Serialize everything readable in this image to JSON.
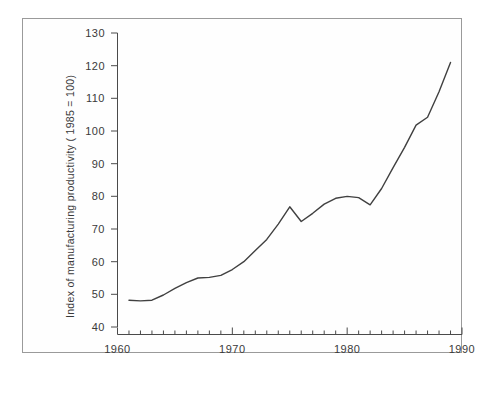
{
  "chart_data": {
    "type": "line",
    "title": "",
    "xlabel": "",
    "ylabel": "Index of manufacturing productivity ( 1985 = 100)",
    "xlim": [
      1960,
      1990
    ],
    "ylim": [
      40,
      130
    ],
    "grid": false,
    "legend": null,
    "y_ticks": [
      40,
      50,
      60,
      70,
      80,
      90,
      100,
      110,
      120,
      130
    ],
    "x_ticks_major": [
      1960,
      1970,
      1980,
      1990
    ],
    "x_tick_labels": [
      "1960",
      "1970",
      "1980",
      "1990"
    ],
    "x_minor_tick_interval": 1,
    "series": [
      {
        "name": "Index of manufacturing productivity",
        "x": [
          1961,
          1962,
          1963,
          1964,
          1965,
          1966,
          1967,
          1968,
          1969,
          1970,
          1971,
          1972,
          1973,
          1974,
          1975,
          1976,
          1977,
          1978,
          1979,
          1980,
          1981,
          1982,
          1983,
          1984,
          1985,
          1986,
          1987,
          1988,
          1989
        ],
        "values": [
          48.2,
          48.0,
          48.2,
          49.8,
          51.8,
          53.6,
          55.0,
          55.2,
          55.8,
          57.6,
          60.0,
          63.4,
          66.8,
          71.5,
          76.8,
          72.3,
          74.8,
          77.6,
          79.4,
          80.0,
          79.6,
          77.4,
          82.4,
          88.8,
          95.0,
          101.8,
          104.2,
          112.0,
          121.0
        ]
      }
    ]
  },
  "axis": {
    "y_label": "Index of manufacturing productivity ( 1985 = 100)",
    "tick_130": "130",
    "tick_120": "120",
    "tick_110": "110",
    "tick_100": "100",
    "tick_90": "90",
    "tick_80": "80",
    "tick_70": "70",
    "tick_60": "60",
    "tick_50": "50",
    "tick_40": "40",
    "x_1960": "1960",
    "x_1970": "1970",
    "x_1980": "1980",
    "x_1990": "1990"
  },
  "colors": {
    "line": "#404040",
    "axis": "#4a4a4a",
    "text": "#3a3a3a",
    "frame": "#9a9a9a",
    "background": "#ffffff"
  }
}
